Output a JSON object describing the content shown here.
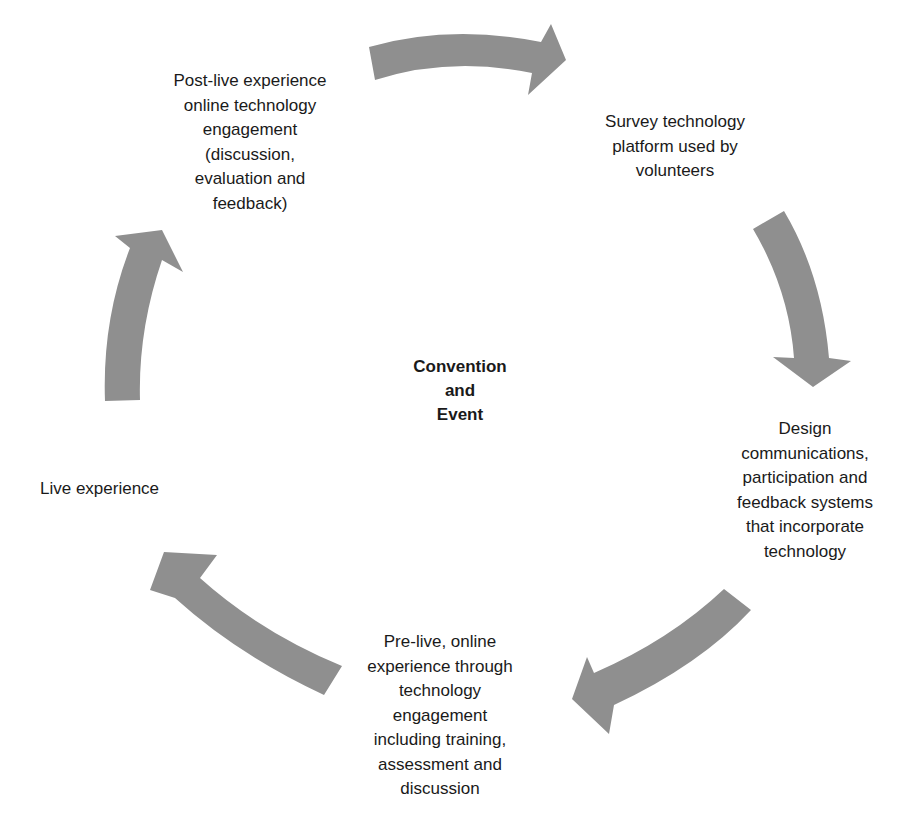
{
  "diagram": {
    "type": "cycle",
    "center": {
      "label": "Convention\nand\nEvent"
    },
    "arrow_color": "#8f8f8f",
    "text_color": "#1a1a1a",
    "nodes": [
      {
        "id": "survey",
        "label": "Survey technology\nplatform used by\nvolunteers"
      },
      {
        "id": "design",
        "label": "Design\ncommunications,\nparticipation and\nfeedback systems\nthat incorporate\ntechnology"
      },
      {
        "id": "pre-live",
        "label": "Pre-live, online\nexperience through\ntechnology\nengagement\nincluding training,\nassessment and\ndiscussion"
      },
      {
        "id": "live",
        "label": "Live experience"
      },
      {
        "id": "post-live",
        "label": "Post-live experience\nonline technology\nengagement\n(discussion,\nevaluation and\nfeedback)"
      }
    ],
    "edges": [
      {
        "from": "post-live",
        "to": "survey"
      },
      {
        "from": "survey",
        "to": "design"
      },
      {
        "from": "design",
        "to": "pre-live"
      },
      {
        "from": "pre-live",
        "to": "live"
      },
      {
        "from": "live",
        "to": "post-live"
      }
    ]
  }
}
